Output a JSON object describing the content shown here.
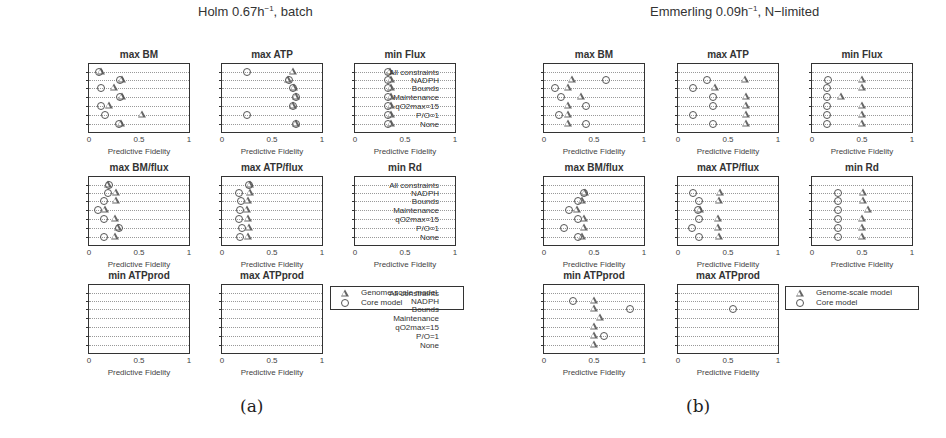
{
  "rows": [
    "All constraints",
    "NADPH",
    "Bounds",
    "Maintenance",
    "qO2max=15",
    "P/O=1",
    "None"
  ],
  "x_ticks": [
    "0",
    "0.5",
    "1"
  ],
  "x_label": "Predictive Fidelity",
  "legend": {
    "genome": "Genome-scale model",
    "core": "Core model"
  },
  "figures": [
    {
      "caption": "(a)",
      "title_main": "Holm 0.67h",
      "title_sup": "−1",
      "title_tail": ", batch",
      "panels": [
        {
          "title": "max BM"
        },
        {
          "title": "max ATP"
        },
        {
          "title": "min Flux"
        },
        {
          "title": "max BM/flux"
        },
        {
          "title": "max ATP/flux"
        },
        {
          "title": "min Rd"
        },
        {
          "title": "min ATPprod"
        },
        {
          "title": "max ATPprod"
        }
      ]
    },
    {
      "caption": "(b)",
      "title_main": "Emmerling 0.09h",
      "title_sup": "−1",
      "title_tail": ", N−limited",
      "panels": [
        {
          "title": "max BM"
        },
        {
          "title": "max ATP"
        },
        {
          "title": "min Flux"
        },
        {
          "title": "max BM/flux"
        },
        {
          "title": "max ATP/flux"
        },
        {
          "title": "min Rd"
        },
        {
          "title": "min ATPprod"
        },
        {
          "title": "max ATPprod"
        }
      ]
    }
  ],
  "chart_data": [
    {
      "type": "scatter",
      "figure": "(a) Holm 0.67h^-1, batch",
      "xlabel": "Predictive Fidelity",
      "xlim": [
        0,
        1
      ],
      "categories": [
        "All constraints",
        "NADPH",
        "Bounds",
        "Maintenance",
        "qO2max=15",
        "P/O=1",
        "None"
      ],
      "subplots": [
        {
          "title": "max BM",
          "series": [
            {
              "name": "Genome-scale model",
              "values": [
                0.12,
                0.33,
                0.25,
                0.33,
                0.2,
                0.53,
                0.32
              ]
            },
            {
              "name": "Core model",
              "values": [
                0.1,
                0.31,
                0.12,
                0.31,
                0.12,
                0.16,
                0.3
              ]
            }
          ]
        },
        {
          "title": "max ATP",
          "series": [
            {
              "name": "Genome-scale model",
              "values": [
                0.71,
                0.66,
                0.72,
                0.74,
                0.71,
                null,
                0.74
              ]
            },
            {
              "name": "Core model",
              "values": [
                0.25,
                0.67,
                0.71,
                0.74,
                0.71,
                0.25,
                0.74
              ]
            }
          ]
        },
        {
          "title": "min Flux",
          "series": [
            {
              "name": "Genome-scale model",
              "values": [
                0.35,
                0.36,
                0.36,
                0.36,
                0.36,
                0.36,
                0.36
              ]
            },
            {
              "name": "Core model",
              "values": [
                0.33,
                0.33,
                0.33,
                0.33,
                0.33,
                0.33,
                0.33
              ]
            }
          ]
        },
        {
          "title": "max BM/flux",
          "series": [
            {
              "name": "Genome-scale model",
              "values": [
                0.19,
                0.27,
                0.27,
                0.16,
                0.26,
                0.29,
                0.26
              ]
            },
            {
              "name": "Core model",
              "values": [
                0.2,
                0.19,
                0.15,
                0.09,
                0.15,
                0.3,
                0.15
              ]
            }
          ]
        },
        {
          "title": "max ATP/flux",
          "series": [
            {
              "name": "Genome-scale model",
              "values": [
                0.28,
                0.28,
                0.26,
                0.25,
                0.26,
                0.27,
                0.26
              ]
            },
            {
              "name": "Core model",
              "values": [
                0.27,
                0.17,
                0.19,
                0.18,
                0.17,
                0.2,
                0.18
              ]
            }
          ]
        },
        {
          "title": "min Rd",
          "series": [
            {
              "name": "Genome-scale model",
              "values": [
                null,
                null,
                null,
                null,
                null,
                null,
                null
              ]
            },
            {
              "name": "Core model",
              "values": [
                null,
                null,
                null,
                null,
                null,
                null,
                null
              ]
            }
          ]
        },
        {
          "title": "min ATPprod",
          "series": [
            {
              "name": "Genome-scale model",
              "values": [
                null,
                null,
                null,
                null,
                null,
                null,
                null
              ]
            },
            {
              "name": "Core model",
              "values": [
                null,
                null,
                null,
                null,
                null,
                null,
                null
              ]
            }
          ]
        },
        {
          "title": "max ATPprod",
          "series": [
            {
              "name": "Genome-scale model",
              "values": [
                null,
                null,
                null,
                null,
                null,
                null,
                null
              ]
            },
            {
              "name": "Core model",
              "values": [
                null,
                null,
                null,
                null,
                null,
                null,
                null
              ]
            }
          ]
        }
      ]
    },
    {
      "type": "scatter",
      "figure": "(b) Emmerling 0.09h^-1, N-limited",
      "xlabel": "Predictive Fidelity",
      "xlim": [
        0,
        1
      ],
      "categories": [
        "All constraints",
        "NADPH",
        "Bounds",
        "Maintenance",
        "qO2max=15",
        "P/O=1",
        "None"
      ],
      "subplots": [
        {
          "title": "max BM",
          "series": [
            {
              "name": "Genome-scale model",
              "values": [
                null,
                0.28,
                0.24,
                0.37,
                0.24,
                0.24,
                0.24
              ]
            },
            {
              "name": "Core model",
              "values": [
                null,
                0.62,
                0.11,
                0.17,
                0.42,
                0.15,
                0.42
              ]
            }
          ]
        },
        {
          "title": "max ATP",
          "series": [
            {
              "name": "Genome-scale model",
              "values": [
                null,
                0.67,
                0.37,
                0.68,
                0.68,
                0.68,
                0.68
              ]
            },
            {
              "name": "Core model",
              "values": [
                null,
                0.29,
                0.15,
                0.35,
                0.35,
                0.15,
                0.35
              ]
            }
          ]
        },
        {
          "title": "min Flux",
          "series": [
            {
              "name": "Genome-scale model",
              "values": [
                null,
                0.5,
                0.5,
                0.29,
                0.5,
                0.5,
                0.5
              ]
            },
            {
              "name": "Core model",
              "values": [
                null,
                0.16,
                0.15,
                0.15,
                0.15,
                0.15,
                0.15
              ]
            }
          ]
        },
        {
          "title": "max BM/flux",
          "series": [
            {
              "name": "Genome-scale model",
              "values": [
                null,
                0.41,
                0.38,
                0.33,
                0.4,
                0.4,
                0.38
              ]
            },
            {
              "name": "Core model",
              "values": [
                null,
                0.4,
                0.34,
                0.25,
                0.34,
                0.2,
                0.34
              ]
            }
          ]
        },
        {
          "title": "max ATP/flux",
          "series": [
            {
              "name": "Genome-scale model",
              "values": [
                null,
                0.42,
                0.41,
                0.22,
                0.4,
                0.4,
                0.41
              ]
            },
            {
              "name": "Core model",
              "values": [
                null,
                0.15,
                0.21,
                0.2,
                0.21,
                0.14,
                0.21
              ]
            }
          ]
        },
        {
          "title": "min Rd",
          "series": [
            {
              "name": "Genome-scale model",
              "values": [
                null,
                0.51,
                0.51,
                0.56,
                0.5,
                0.5,
                0.5
              ]
            },
            {
              "name": "Core model",
              "values": [
                null,
                0.26,
                0.26,
                0.26,
                0.26,
                0.26,
                0.26
              ]
            }
          ]
        },
        {
          "title": "min ATPprod",
          "series": [
            {
              "name": "Genome-scale model",
              "values": [
                null,
                0.5,
                0.5,
                0.56,
                0.5,
                0.5,
                0.5
              ]
            },
            {
              "name": "Core model",
              "values": [
                null,
                0.29,
                0.86,
                null,
                null,
                0.6,
                null
              ]
            }
          ]
        },
        {
          "title": "max ATPprod",
          "series": [
            {
              "name": "Genome-scale model",
              "values": [
                null,
                null,
                null,
                null,
                null,
                null,
                null
              ]
            },
            {
              "name": "Core model",
              "values": [
                null,
                null,
                0.55,
                null,
                null,
                null,
                null
              ]
            }
          ]
        }
      ]
    }
  ]
}
